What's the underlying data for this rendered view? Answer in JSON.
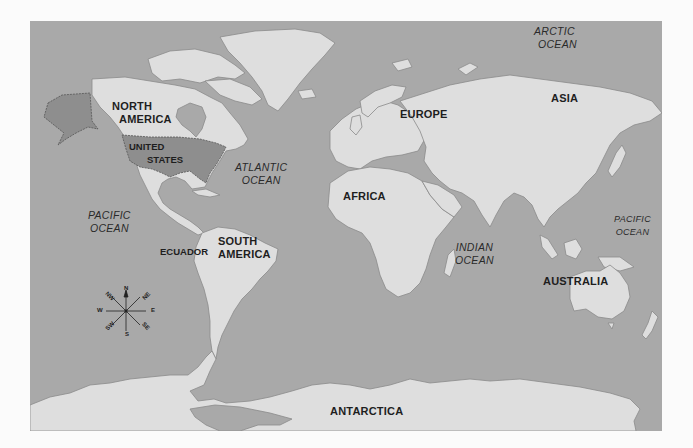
{
  "map": {
    "type": "world-map",
    "colors": {
      "ocean": "#a9a9a9",
      "land": "#dedede",
      "highlight_country": "#8e8e8e",
      "coastline": "#8a8a8a",
      "label_text": "#1e1e1e",
      "page_background": "#fbfbfb"
    },
    "continents": [
      {
        "id": "north-america",
        "line1": "NORTH",
        "line2": "AMERICA"
      },
      {
        "id": "south-america",
        "line1": "SOUTH",
        "line2": "AMERICA"
      },
      {
        "id": "europe",
        "line1": "EUROPE"
      },
      {
        "id": "asia",
        "line1": "ASIA"
      },
      {
        "id": "africa",
        "line1": "AFRICA"
      },
      {
        "id": "australia",
        "line1": "AUSTRALIA"
      },
      {
        "id": "antarctica",
        "line1": "ANTARCTICA"
      }
    ],
    "oceans": [
      {
        "id": "arctic",
        "line1": "ARCTIC",
        "line2": "OCEAN"
      },
      {
        "id": "atlantic",
        "line1": "ATLANTIC",
        "line2": "OCEAN"
      },
      {
        "id": "pacific-west",
        "line1": "PACIFIC",
        "line2": "OCEAN"
      },
      {
        "id": "pacific-east",
        "line1": "PACIFIC",
        "line2": "OCEAN"
      },
      {
        "id": "indian",
        "line1": "INDIAN",
        "line2": "OCEAN"
      }
    ],
    "countries": [
      {
        "id": "united-states",
        "line1": "UNITED",
        "line2": "STATES",
        "highlighted": true
      },
      {
        "id": "ecuador",
        "line1": "ECUADOR",
        "highlighted": false
      }
    ],
    "compass": {
      "labels": [
        "N",
        "NE",
        "E",
        "SE",
        "S",
        "SW",
        "W",
        "NW"
      ]
    }
  }
}
